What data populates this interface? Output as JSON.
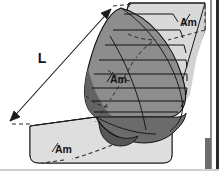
{
  "figure": {
    "width": 219,
    "height": 171,
    "background": "#ffffff"
  },
  "labels": {
    "length": "L",
    "midship_top": "Am",
    "midship_center": "Am",
    "midship_bottom": "Am"
  },
  "colors": {
    "prism_top": "#d2d2d2",
    "prism_side": "#c9c9c9",
    "prism_end": "#dcdcdc",
    "hull_station": "#8d8d8d",
    "hull_shadow": "#6b6b6b",
    "hull_dark": "#5c5c5c",
    "outline": "#1a1a1a",
    "dashed": "#2b2b2b",
    "frame": "#000000",
    "label_text": "#141414"
  },
  "annotations": {
    "dimension_line": "L",
    "arrow_count": 2,
    "station_count": 9,
    "hidden_edges": "dashed"
  }
}
